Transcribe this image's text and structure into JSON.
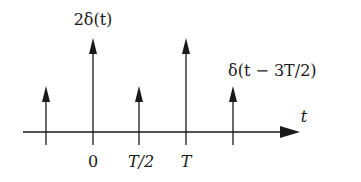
{
  "diagram": {
    "type": "impulse-train",
    "axis_label": "t",
    "tick_labels": [
      "0",
      "T/2",
      "T"
    ],
    "impulses": [
      {
        "position": "-T/2",
        "height": 1,
        "label": ""
      },
      {
        "position": "0",
        "height": 2,
        "label": "2δ(t)"
      },
      {
        "position": "T/2",
        "height": 1,
        "label": ""
      },
      {
        "position": "T",
        "height": 2,
        "label": ""
      },
      {
        "position": "3T/2",
        "height": 1,
        "label": "δ(t − 3T/2)"
      }
    ],
    "labels": {
      "impulse_zero": "2δ(t)",
      "impulse_three_half": "δ(t − 3T/2)",
      "tick_zero": "0",
      "tick_half": "T/2",
      "tick_T": "T",
      "axis": "t"
    },
    "colors": {
      "stroke": "#1a1a1a",
      "background": "#ffffff"
    }
  }
}
